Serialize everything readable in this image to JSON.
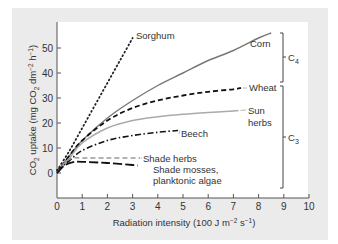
{
  "chart_data": {
    "type": "line",
    "title": "",
    "xlabel": "Radiation intensity (100 J m⁻² s⁻¹)",
    "ylabel": "CO₂ uptake (mg CO₂ dm⁻² h⁻¹)",
    "xlim": [
      0,
      10
    ],
    "ylim": [
      -7,
      60
    ],
    "x_ticks": [
      "0",
      "1",
      "2",
      "3",
      "4",
      "5",
      "6",
      "7",
      "8",
      "9",
      "10"
    ],
    "y_ticks": [
      "0",
      "10",
      "20",
      "30",
      "40",
      "50"
    ],
    "grid": false,
    "legend": "inline labels",
    "series": [
      {
        "name": "Sorghum",
        "style": "dotted",
        "color": "#222222",
        "x": [
          0,
          0.5,
          1.0,
          1.5,
          2.0,
          2.5,
          3.0
        ],
        "y": [
          1,
          9,
          18,
          27,
          36,
          45,
          54
        ]
      },
      {
        "name": "Corn",
        "style": "solid",
        "color": "#777777",
        "x": [
          0,
          0.5,
          1,
          2,
          3,
          4,
          5,
          6,
          7,
          8,
          8.5
        ],
        "y": [
          0,
          7,
          13,
          22,
          29,
          35,
          40,
          45,
          49,
          54,
          56
        ]
      },
      {
        "name": "Wheat",
        "style": "dashed",
        "color": "#111111",
        "x": [
          0,
          0.5,
          1,
          2,
          3,
          4,
          5,
          6,
          7,
          7.3
        ],
        "y": [
          0,
          7,
          13,
          21,
          26,
          29,
          31,
          32.5,
          33.5,
          34
        ]
      },
      {
        "name": "Sun herbs",
        "style": "solid",
        "color": "#aaaaaa",
        "x": [
          0,
          0.5,
          1,
          2,
          3,
          4,
          5,
          6,
          7,
          7.2
        ],
        "y": [
          0,
          6,
          12,
          18,
          21,
          22.5,
          23.5,
          24.2,
          24.8,
          25
        ]
      },
      {
        "name": "Beech",
        "style": "dash-dot",
        "color": "#111111",
        "x": [
          0,
          0.5,
          1,
          2,
          3,
          4,
          4.8
        ],
        "y": [
          1,
          5,
          9,
          13,
          15,
          16.3,
          17
        ]
      },
      {
        "name": "Shade herbs",
        "style": "dashed",
        "color": "#999999",
        "x": [
          0,
          0.3,
          0.6,
          1,
          2,
          3,
          3.3
        ],
        "y": [
          0,
          4,
          6,
          6,
          6,
          6,
          6
        ]
      },
      {
        "name": "Shade mosses, planktonic algae",
        "style": "long-dash",
        "color": "#111111",
        "x": [
          0,
          0.3,
          0.6,
          1,
          2,
          3,
          3.2
        ],
        "y": [
          0,
          3,
          4.3,
          4.5,
          4,
          3.2,
          3
        ]
      }
    ],
    "annotations": [
      {
        "text": "C₄",
        "type": "bracket",
        "groups": [
          "Sorghum",
          "Corn"
        ]
      },
      {
        "text": "C₃",
        "type": "bracket",
        "groups": [
          "Wheat",
          "Sun herbs",
          "Beech",
          "Shade herbs",
          "Shade mosses, planktonic algae"
        ]
      }
    ]
  },
  "labels": {
    "sorghum": "Sorghum",
    "corn": "Corn",
    "wheat": "Wheat",
    "sun_herbs_1": "Sun",
    "sun_herbs_2": "herbs",
    "beech": "Beech",
    "shade_herbs": "Shade herbs",
    "shade_mosses_1": "Shade mosses,",
    "shade_mosses_2": "planktonic algae",
    "c4_main": "C",
    "c4_sub": "4",
    "c3_main": "C",
    "c3_sub": "3",
    "ylabel_a": "CO",
    "ylabel_b": "2",
    "ylabel_c": " uptake (mg CO",
    "ylabel_d": "2",
    "ylabel_e": " dm",
    "ylabel_f": "−2",
    "ylabel_g": " h",
    "ylabel_h": "−1",
    "ylabel_i": ")",
    "xlabel_a": "Radiation intensity (100 J m",
    "xlabel_b": "−2",
    "xlabel_c": " s",
    "xlabel_d": "−1",
    "xlabel_e": ")"
  }
}
